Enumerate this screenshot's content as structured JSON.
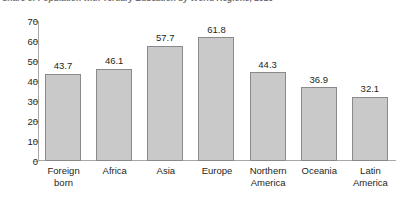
{
  "figure": {
    "title": "Share of Population with Tertiary Education by World Regions, 2010",
    "title_note": "clipped-at-top-edge"
  },
  "chart_data": {
    "type": "bar",
    "title": "Share of Population with Tertiary Education by World Regions, 2010",
    "xlabel": "",
    "ylabel": "",
    "ylim": [
      0,
      70
    ],
    "yticks": [
      0,
      10,
      20,
      30,
      40,
      50,
      60,
      70
    ],
    "grid": false,
    "legend": "none",
    "bar_fill": "#c9c9c9",
    "bar_stroke": "#8a8a8a",
    "categories": [
      "Foreign born",
      "Africa",
      "Asia",
      "Europe",
      "Northern America",
      "Oceania",
      "Latin America"
    ],
    "category_lines": [
      [
        "Foreign",
        "born"
      ],
      [
        "Africa"
      ],
      [
        "Asia"
      ],
      [
        "Europe"
      ],
      [
        "Northern",
        "America"
      ],
      [
        "Oceania"
      ],
      [
        "Latin",
        "America"
      ]
    ],
    "values": [
      43.7,
      46.1,
      57.7,
      61.8,
      44.3,
      36.9,
      32.1
    ],
    "value_labels": [
      "43.7",
      "46.1",
      "57.7",
      "61.8",
      "44.3",
      "36.9",
      "32.1"
    ]
  }
}
